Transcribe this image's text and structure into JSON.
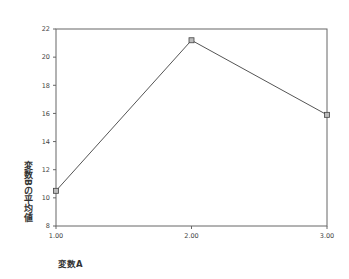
{
  "chart_data": {
    "type": "line",
    "title": "",
    "xlabel": "変数A",
    "ylabel": "変数Bの平均値",
    "categories": [
      "1.00",
      "2.00",
      "3.00"
    ],
    "x": [
      1.0,
      2.0,
      3.0
    ],
    "values": [
      10.5,
      21.2,
      15.9
    ],
    "series": [
      {
        "name": "変数Bの平均値",
        "values": [
          10.5,
          21.2,
          15.9
        ],
        "marker": "square"
      }
    ],
    "ylim": [
      8,
      22
    ],
    "yticks": [
      "22",
      "20",
      "18",
      "16",
      "14",
      "12",
      "10",
      "8"
    ],
    "xticks": [
      "1.00",
      "2.00",
      "3.00"
    ],
    "grid": false,
    "legend": null
  }
}
